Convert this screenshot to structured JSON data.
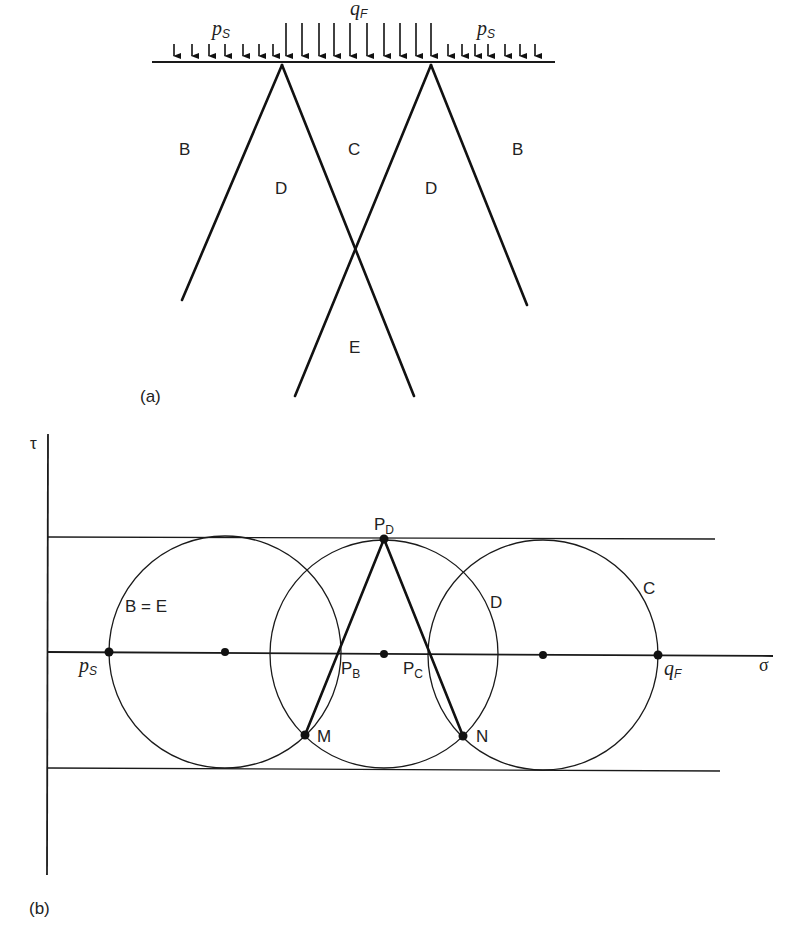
{
  "figure_a": {
    "panel_label": "(a)",
    "loads": {
      "surcharge_left": {
        "symbol": "p",
        "subscript": "S"
      },
      "surcharge_right": {
        "symbol": "p",
        "subscript": "S"
      },
      "foundation": {
        "symbol": "q",
        "subscript": "F"
      }
    },
    "zones": {
      "b_left": "B",
      "c": "C",
      "b_right": "B",
      "d_left": "D",
      "d_right": "D",
      "e": "E"
    }
  },
  "figure_b": {
    "panel_label": "(b)",
    "axes": {
      "y": "τ",
      "x": "σ"
    },
    "circle_labels": {
      "be": "B = E",
      "d": "D",
      "c": "C"
    },
    "points": {
      "ps": {
        "symbol": "p",
        "subscript": "S"
      },
      "qf": {
        "symbol": "q",
        "subscript": "F"
      },
      "pd": {
        "symbol": "P",
        "subscript": "D"
      },
      "pb": {
        "symbol": "P",
        "subscript": "B"
      },
      "pc": {
        "symbol": "P",
        "subscript": "C"
      },
      "m": "M",
      "n": "N"
    }
  }
}
